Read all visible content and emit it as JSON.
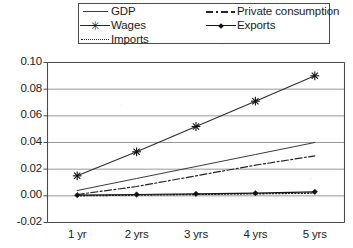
{
  "legend": {
    "entries": [
      {
        "label": "GDP",
        "key": "solid-thin-line-key",
        "column": "left"
      },
      {
        "label": "Wages",
        "key": "solid-asterisk-key",
        "column": "left"
      },
      {
        "label": "Imports",
        "key": "dotted-line-key",
        "column": "left"
      },
      {
        "label": "Private consumption",
        "key": "dash-dot-line-key",
        "column": "right"
      },
      {
        "label": "Exports",
        "key": "solid-diamond-key",
        "column": "right"
      }
    ],
    "marker_glyphs": {
      "asterisk": "✳",
      "diamond": "◆"
    }
  },
  "axes": {
    "y_ticks": [
      "0.10",
      "0.08",
      "0.06",
      "0.04",
      "0.02",
      "0.00",
      "-0.02"
    ],
    "x_ticks": [
      "1 yr",
      "2 yrs",
      "3 yrs",
      "4 yrs",
      "5 yrs"
    ]
  },
  "colors": {
    "axis": "#4a4a4a",
    "grid": "#8c8c8c",
    "ink": "#1a1a1a",
    "series_gdp": "#3a3a3a",
    "series_wages": "#2b2b2b",
    "series_imports": "#242424",
    "series_private_consumption": "#242424",
    "series_exports": "#151515",
    "background": "#ffffff"
  },
  "chart_data": {
    "type": "line",
    "title": "",
    "xlabel": "",
    "ylabel": "",
    "categories": [
      "1 yr",
      "2 yrs",
      "3 yrs",
      "4 yrs",
      "5 yrs"
    ],
    "ylim": [
      -0.02,
      0.1
    ],
    "ytick_values": [
      -0.02,
      0.0,
      0.02,
      0.04,
      0.06,
      0.08,
      0.1
    ],
    "grid": "horizontal",
    "legend_position": "top",
    "series": [
      {
        "name": "GDP",
        "style": "solid",
        "marker": "none",
        "values": [
          0.004,
          0.013,
          0.022,
          0.031,
          0.04
        ]
      },
      {
        "name": "Wages",
        "style": "solid",
        "marker": "asterisk",
        "values": [
          0.015,
          0.033,
          0.052,
          0.071,
          0.09
        ]
      },
      {
        "name": "Imports",
        "style": "dotted",
        "marker": "none",
        "values": [
          0.0,
          0.0005,
          0.001,
          0.0015,
          0.002
        ]
      },
      {
        "name": "Private consumption",
        "style": "dashdot",
        "marker": "none",
        "values": [
          0.001,
          0.007,
          0.015,
          0.023,
          0.03
        ]
      },
      {
        "name": "Exports",
        "style": "solid",
        "marker": "diamond",
        "values": [
          0.0005,
          0.001,
          0.0015,
          0.002,
          0.003
        ]
      }
    ]
  }
}
